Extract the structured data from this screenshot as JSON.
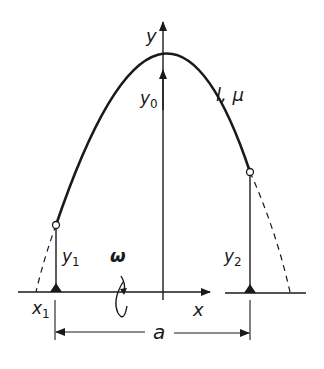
{
  "diagram": {
    "labels": {
      "y_axis": "y",
      "x_axis": "x",
      "apex_height": "y",
      "apex_height_sub": "0",
      "cable_props": "l, μ",
      "left_height": "y",
      "left_height_sub": "1",
      "right_height": "y",
      "right_height_sub": "2",
      "left_x": "x",
      "left_x_sub": "1",
      "omega": "ω",
      "span": "a"
    },
    "colors": {
      "ink": "#1a1a1a",
      "background": "#ffffff"
    }
  }
}
